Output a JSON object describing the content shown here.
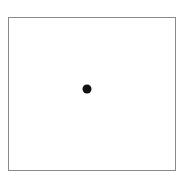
{
  "figure": {
    "frame": {
      "border_color": "#8a8a8a",
      "background": "#ffffff"
    },
    "dot": {
      "color": "#111111",
      "center_x": 87,
      "center_y": 89,
      "diameter": 9
    }
  }
}
